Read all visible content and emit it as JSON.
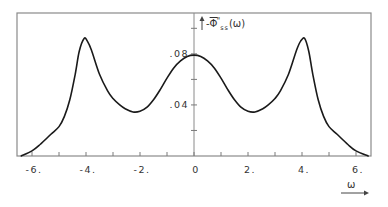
{
  "chart_data": {
    "type": "line",
    "title": "",
    "xlabel": "ω",
    "ylabel": "-Φ̄''ss(ω)",
    "ylabel_parts": {
      "prefix": "-",
      "symbol": "Φ",
      "superscript": "\"",
      "subscript": "ss",
      "suffix": "(ω)"
    },
    "xlim": [
      -6.55,
      6.55
    ],
    "ylim": [
      0,
      0.112
    ],
    "grid": false,
    "legend": null,
    "x_ticks": [
      -6,
      -5,
      -4,
      -3,
      -2,
      -1,
      0,
      1,
      2,
      3,
      4,
      5,
      6
    ],
    "x_tick_labels": [
      {
        "value": -6,
        "label": "-6."
      },
      {
        "value": -4,
        "label": "-4."
      },
      {
        "value": -2,
        "label": "-2."
      },
      {
        "value": 0,
        "label": "0"
      },
      {
        "value": 2,
        "label": "2."
      },
      {
        "value": 4,
        "label": "4."
      },
      {
        "value": 6,
        "label": "6."
      }
    ],
    "y_ticks": [
      0.02,
      0.04,
      0.06,
      0.08,
      0.1
    ],
    "y_tick_labels": [
      {
        "value": 0.04,
        "label": ".04"
      },
      {
        "value": 0.08,
        "label": ".08"
      }
    ],
    "series": [
      {
        "name": "-Φ̄''ss(ω)",
        "color": "#1a1a1a",
        "x": [
          -6.4,
          -6.0,
          -5.7,
          -5.3,
          -5.0,
          -4.8,
          -4.6,
          -4.4,
          -4.25,
          -4.07,
          -3.95,
          -3.8,
          -3.5,
          -3.2,
          -3.0,
          -2.75,
          -2.55,
          -2.26,
          -2.0,
          -1.75,
          -1.5,
          -1.25,
          -1.0,
          -0.75,
          -0.5,
          -0.25,
          0.0,
          0.25,
          0.5,
          0.75,
          1.0,
          1.25,
          1.5,
          1.75,
          2.0,
          2.26,
          2.55,
          2.75,
          3.0,
          3.2,
          3.5,
          3.8,
          3.95,
          4.1,
          4.25,
          4.4,
          4.6,
          4.8,
          5.0,
          5.3,
          5.7,
          6.0,
          6.45
        ],
        "y": [
          0.0,
          0.004,
          0.009,
          0.017,
          0.023,
          0.031,
          0.044,
          0.064,
          0.082,
          0.092,
          0.09,
          0.083,
          0.064,
          0.051,
          0.045,
          0.04,
          0.037,
          0.0345,
          0.035,
          0.038,
          0.044,
          0.052,
          0.061,
          0.069,
          0.0745,
          0.078,
          0.079,
          0.078,
          0.0745,
          0.069,
          0.061,
          0.052,
          0.044,
          0.038,
          0.035,
          0.0345,
          0.037,
          0.04,
          0.045,
          0.051,
          0.064,
          0.083,
          0.09,
          0.092,
          0.082,
          0.064,
          0.044,
          0.031,
          0.023,
          0.017,
          0.009,
          0.004,
          0.0
        ]
      }
    ]
  },
  "axis": {
    "x_symbol": "ω",
    "y_prefix": "-",
    "y_symbol": "Φ",
    "y_superscript": "\"",
    "y_subscript": "ss",
    "y_suffix": "(ω)"
  },
  "colors": {
    "curve": "#1a1a1a",
    "frame": "#7a7a7a",
    "axis": "#7a7a7a",
    "background": "#ffffff"
  }
}
